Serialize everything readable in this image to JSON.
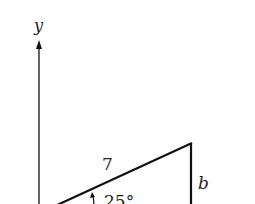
{
  "diagram": {
    "axis_label_y": "y",
    "hypotenuse_label": "7",
    "side_label": "b",
    "angle_label": "25°",
    "colors": {
      "stroke": "#111111",
      "text": "#222222",
      "background": "#ffffff"
    }
  }
}
